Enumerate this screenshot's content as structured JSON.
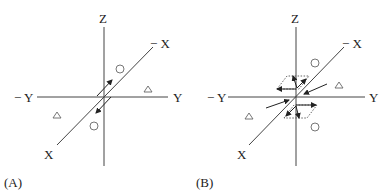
{
  "panels": [
    {
      "id": "A",
      "caption": "(A)",
      "axis_labels": {
        "z": "Z",
        "neg_x": "− X",
        "neg_y": "− Y",
        "y": "Y",
        "x": "X"
      },
      "symbols": [
        "circle",
        "circle",
        "triangle",
        "triangle"
      ]
    },
    {
      "id": "B",
      "caption": "(B)",
      "axis_labels": {
        "z": "Z",
        "neg_x": "− X",
        "neg_y": "− Y",
        "y": "Y",
        "x": "X"
      },
      "symbols": [
        "circle",
        "circle",
        "triangle",
        "triangle"
      ]
    }
  ]
}
